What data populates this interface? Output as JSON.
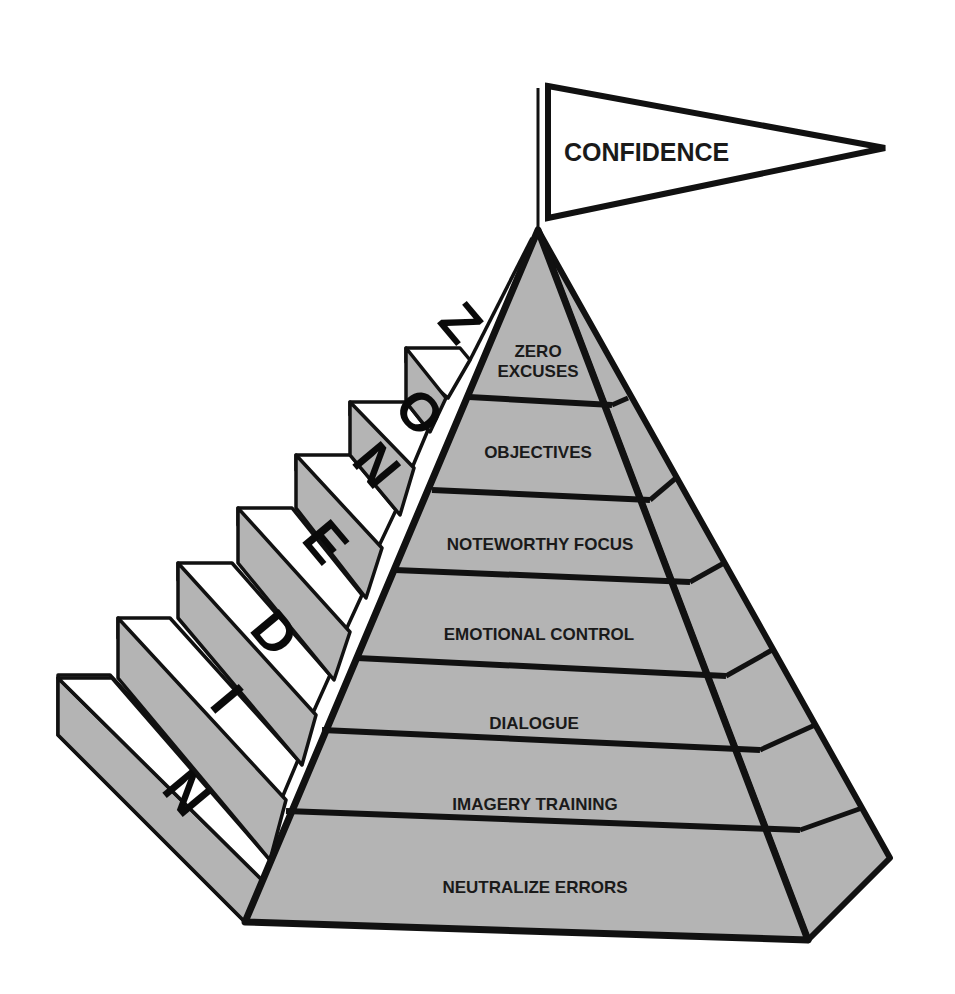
{
  "diagram": {
    "type": "pyramid-with-stairs",
    "flag": {
      "label": "CONFIDENCE"
    },
    "tiers": [
      {
        "label_lines": [
          "ZERO",
          "EXCUSES"
        ]
      },
      {
        "label_lines": [
          "OBJECTIVES"
        ]
      },
      {
        "label_lines": [
          "NOTEWORTHY FOCUS"
        ]
      },
      {
        "label_lines": [
          "EMOTIONAL CONTROL"
        ]
      },
      {
        "label_lines": [
          "DIALOGUE"
        ]
      },
      {
        "label_lines": [
          "IMAGERY TRAINING"
        ]
      },
      {
        "label_lines": [
          "NEUTRALIZE ERRORS"
        ]
      }
    ],
    "stairs_word": "NIDENOZ",
    "stair_letters": [
      "N",
      "I",
      "D",
      "E",
      "N",
      "O",
      "Z"
    ],
    "colors": {
      "face": "#b4b4b4",
      "stair_top": "#ffffff",
      "outline": "#111111",
      "text": "#1a1a1a"
    }
  }
}
